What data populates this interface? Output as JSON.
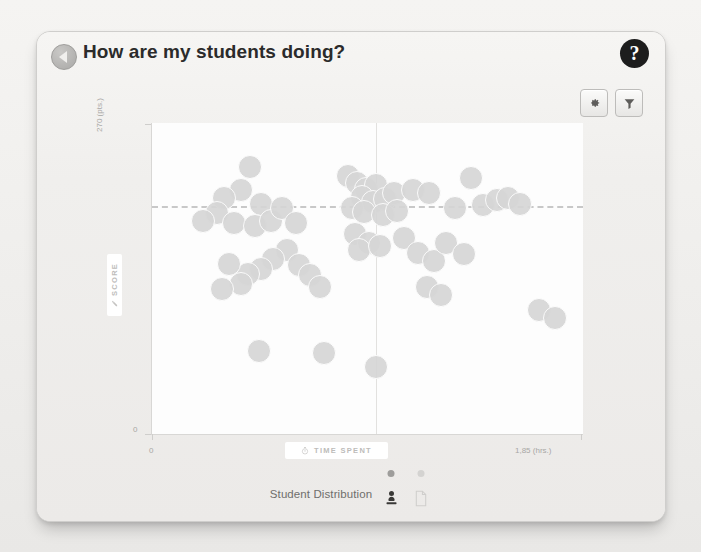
{
  "header": {
    "back_icon": "back-triangle-icon",
    "title": "How are my students doing?",
    "help_icon": "question-mark-icon",
    "help_label": "?"
  },
  "toolbar": {
    "settings_icon": "gear-icon",
    "settings_label": "Settings",
    "filter_icon": "funnel-icon",
    "filter_label": "Filter"
  },
  "footer": {
    "label": "Student Distribution",
    "toggles": [
      {
        "name": "students-view",
        "icon": "person-icon",
        "active": true
      },
      {
        "name": "assignments-view",
        "icon": "document-icon",
        "active": false
      }
    ]
  },
  "colors": {
    "dot": "#d6d6d6",
    "plot_bg": "#fdfdfd",
    "card_bg": "#f1f0ee",
    "axis_text": "#a8a7a5",
    "reference_line": "#c8c8c8",
    "title_text": "#2b2b2b",
    "help_bg": "#1d1d1d"
  },
  "chart_data": {
    "type": "scatter",
    "title": "",
    "xlabel": "TIME SPENT",
    "ylabel": "SCORE",
    "xlabel_icon": "clock-icon",
    "ylabel_icon": "pencil-icon",
    "x_tick_labels": [
      "0",
      "1,85 (hrs.)"
    ],
    "y_tick_labels": [
      "0",
      "270 (pts.)"
    ],
    "xlim": [
      0,
      1.85
    ],
    "ylim": [
      0,
      270
    ],
    "grid": false,
    "legend_position": "bottom",
    "reference_lines": [
      {
        "orientation": "horizontal",
        "value": 197,
        "style": "dashed"
      },
      {
        "orientation": "vertical",
        "value": 0.96,
        "style": "solid"
      }
    ],
    "series": [
      {
        "name": "Students",
        "marker": "circle",
        "color": "#d6d6d6",
        "points": [
          [
            0.42,
            232
          ],
          [
            0.38,
            212
          ],
          [
            0.31,
            205
          ],
          [
            0.47,
            200
          ],
          [
            0.28,
            192
          ],
          [
            0.22,
            185
          ],
          [
            0.35,
            183
          ],
          [
            0.44,
            181
          ],
          [
            0.51,
            185
          ],
          [
            0.56,
            196
          ],
          [
            0.62,
            183
          ],
          [
            0.84,
            224
          ],
          [
            0.88,
            218
          ],
          [
            0.92,
            213
          ],
          [
            0.96,
            216
          ],
          [
            0.9,
            206
          ],
          [
            0.95,
            201
          ],
          [
            1.0,
            204
          ],
          [
            1.04,
            209
          ],
          [
            0.86,
            196
          ],
          [
            0.91,
            193
          ],
          [
            0.99,
            190
          ],
          [
            1.05,
            194
          ],
          [
            1.12,
            212
          ],
          [
            1.19,
            209
          ],
          [
            1.3,
            196
          ],
          [
            1.37,
            222
          ],
          [
            1.42,
            199
          ],
          [
            1.48,
            203
          ],
          [
            1.53,
            205
          ],
          [
            1.58,
            200
          ],
          [
            0.58,
            160
          ],
          [
            0.52,
            152
          ],
          [
            0.47,
            143
          ],
          [
            0.41,
            139
          ],
          [
            0.33,
            148
          ],
          [
            0.38,
            130
          ],
          [
            0.3,
            126
          ],
          [
            0.63,
            147
          ],
          [
            0.68,
            138
          ],
          [
            0.72,
            128
          ],
          [
            0.87,
            174
          ],
          [
            0.93,
            166
          ],
          [
            0.89,
            160
          ],
          [
            0.98,
            163
          ],
          [
            1.08,
            170
          ],
          [
            1.14,
            157
          ],
          [
            1.21,
            150
          ],
          [
            1.26,
            166
          ],
          [
            1.34,
            156
          ],
          [
            1.18,
            128
          ],
          [
            1.24,
            121
          ],
          [
            1.66,
            108
          ],
          [
            1.73,
            101
          ],
          [
            0.46,
            72
          ],
          [
            0.74,
            70
          ],
          [
            0.96,
            58
          ]
        ]
      }
    ]
  }
}
